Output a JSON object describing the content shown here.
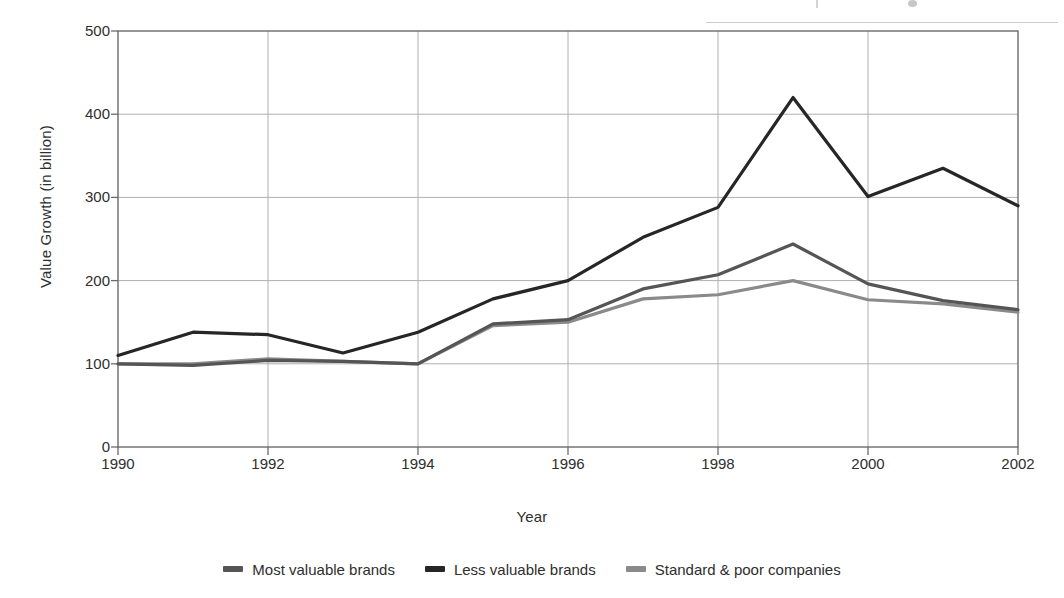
{
  "chart_data": {
    "type": "line",
    "title": "",
    "xlabel": "Year",
    "ylabel": "Value Growth (in billion)",
    "x": [
      1990,
      1991,
      1992,
      1993,
      1994,
      1995,
      1996,
      1997,
      1998,
      1999,
      2000,
      2001,
      2002
    ],
    "xlim": [
      1990,
      2002
    ],
    "ylim": [
      0,
      500
    ],
    "yticks": [
      0,
      100,
      200,
      300,
      400,
      500
    ],
    "xticks": [
      1990,
      1992,
      1994,
      1996,
      1998,
      2000,
      2002
    ],
    "xtick_labels": [
      "1990",
      "1992",
      "1994",
      "1996",
      "1998",
      "2000",
      "2002"
    ],
    "ytick_labels": [
      "0",
      "100",
      "200",
      "300",
      "400",
      "500"
    ],
    "grid": true,
    "grid_axis": "both",
    "legend_position": "bottom",
    "series": [
      {
        "name": "Most valuable brands",
        "color": "#555555",
        "values": [
          100,
          98,
          104,
          103,
          100,
          148,
          153,
          190,
          207,
          244,
          196,
          176,
          165
        ]
      },
      {
        "name": "Less valuable brands",
        "color": "#262626",
        "values": [
          110,
          138,
          135,
          113,
          138,
          178,
          200,
          252,
          288,
          420,
          301,
          335,
          290
        ]
      },
      {
        "name": "Standard & poor companies",
        "color": "#8a8a8a",
        "values": [
          100,
          100,
          106,
          103,
          100,
          146,
          150,
          178,
          183,
          200,
          177,
          172,
          162
        ]
      }
    ],
    "low_dark_series_note": "",
    "annotations": []
  },
  "legend": {
    "items": [
      {
        "label": "Most valuable brands",
        "color": "#555555"
      },
      {
        "label": "Less valuable brands",
        "color": "#262626"
      },
      {
        "label": "Standard & poor companies",
        "color": "#8a8a8a"
      }
    ]
  },
  "axes": {
    "y_title": "Value Growth (in billion)",
    "x_title": "Year"
  },
  "style": {
    "plot_border": "#6b6b6b",
    "grid_color": "#b0b0b0",
    "background": "#ffffff",
    "text_color": "#2e2e2e"
  }
}
